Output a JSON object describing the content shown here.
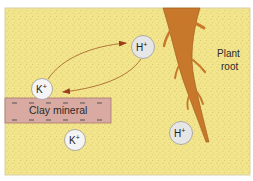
{
  "diagram": {
    "colors": {
      "soil": "#f3e58c",
      "soil_speckle": "#c9b85a",
      "clay": "#d8aaa2",
      "clay_border": "#a8786f",
      "root": "#c8782a",
      "root_edge": "#9a5518",
      "ion_fill": "#ececec",
      "ion_stroke": "#9a9a9a",
      "arrow": "#9a3b1e"
    },
    "labels": {
      "clay": "Clay mineral",
      "root_line1": "Plant",
      "root_line2": "root"
    },
    "ions": [
      {
        "id": "k-upper",
        "symbol": "K",
        "charge": "+",
        "cx": 42,
        "cy": 89
      },
      {
        "id": "k-lower",
        "symbol": "K",
        "charge": "+",
        "cx": 75,
        "cy": 140
      },
      {
        "id": "h-upper",
        "symbol": "H",
        "charge": "+",
        "cx": 143,
        "cy": 47
      },
      {
        "id": "h-lower",
        "symbol": "H",
        "charge": "+",
        "cx": 181,
        "cy": 133
      }
    ],
    "clay_charges": {
      "top": [
        "−",
        "−",
        "−",
        "−",
        "−",
        "−"
      ],
      "bottom": [
        "−",
        "−",
        "−",
        "−",
        "−",
        "−"
      ]
    },
    "arrows": [
      {
        "id": "k-to-h",
        "from": "K+",
        "to": "H+"
      },
      {
        "id": "h-to-k",
        "from": "H+",
        "to": "K+"
      }
    ]
  }
}
